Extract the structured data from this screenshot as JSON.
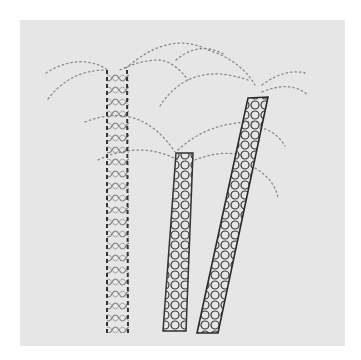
{
  "image": {
    "subject": "embroidered palm trees on linen",
    "colors": {
      "background": "#ffffff",
      "fabric": "#e6e6e6",
      "thread_dark": "#2a2a2a",
      "thread_light": "#8a8a8a"
    },
    "trees": [
      {
        "name": "left-palm",
        "trunk": "straight vertical lattice trunk"
      },
      {
        "name": "middle-palm",
        "trunk": "short slightly tilted lattice trunk"
      },
      {
        "name": "right-palm",
        "trunk": "tall leaning lattice trunk"
      }
    ]
  }
}
